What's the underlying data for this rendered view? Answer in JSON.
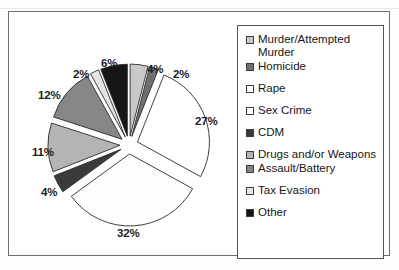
{
  "chart_data": {
    "type": "pie",
    "title": "",
    "legend_position": "right",
    "exploded": true,
    "start_angle_deg": 0,
    "direction": "clockwise",
    "categories": [
      "Murder/Attempted Murder",
      "Homicide",
      "Rape",
      "Sex Crime",
      "CDM",
      "Drugs and/or Weapons",
      "Assault/Battery",
      "Tax Evasion",
      "Other"
    ],
    "values": [
      4,
      2,
      27,
      32,
      4,
      11,
      12,
      2,
      6
    ],
    "value_labels": [
      "4%",
      "2%",
      "27%",
      "32%",
      "4%",
      "11%",
      "12%",
      "2%",
      "6%"
    ],
    "colors": [
      "#c8c8c8",
      "#6f6f6f",
      "#ffffff",
      "#fdfdfd",
      "#3a3a3a",
      "#b4b4b4",
      "#868686",
      "#e4e4e4",
      "#161616"
    ],
    "unit": "%"
  },
  "legend": {
    "items": [
      {
        "label": "Murder/Attempted Murder",
        "swatch": "#c8c8c8"
      },
      {
        "label": "Homicide",
        "swatch": "#6f6f6f"
      },
      {
        "label": "Rape",
        "swatch": "#ffffff"
      },
      {
        "label": "Sex Crime",
        "swatch": "#ffffff"
      },
      {
        "label": "CDM",
        "swatch": "#3a3a3a"
      },
      {
        "label": "Drugs and/or Weapons",
        "swatch": "#b4b4b4"
      },
      {
        "label": "Assault/Battery",
        "swatch": "#868686"
      },
      {
        "label": "Tax Evasion",
        "swatch": "#e4e4e4"
      },
      {
        "label": "Other",
        "swatch": "#161616"
      }
    ]
  },
  "labels": {
    "p0": "4%",
    "p1": "2%",
    "p2": "27%",
    "p3": "32%",
    "p4": "4%",
    "p5": "11%",
    "p6": "12%",
    "p7": "2%",
    "p8": "6%"
  }
}
